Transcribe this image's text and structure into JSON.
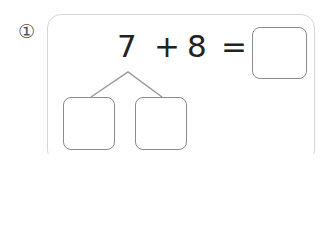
{
  "problem": {
    "number_label": "①",
    "operand_a": "7",
    "operator": "+",
    "operand_b": "8",
    "equals": "=",
    "answer_box_value": "",
    "decompose_left_value": "",
    "decompose_right_value": ""
  },
  "colors": {
    "frame_border": "#d6d6d6",
    "box_border": "#8c8c8c",
    "text": "#222222"
  }
}
